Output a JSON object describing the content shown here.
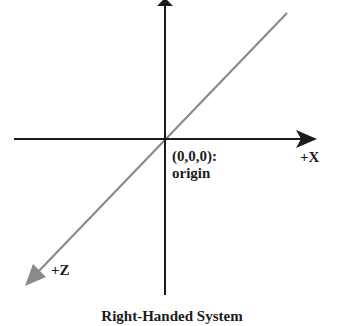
{
  "diagram": {
    "title": "Right-Handed System",
    "origin": {
      "coords_label": "(0,0,0):",
      "name_label": "origin"
    },
    "axes": [
      {
        "id": "y",
        "label": "",
        "direction": "up",
        "color": "#1c1c1c"
      },
      {
        "id": "x",
        "label": "+X",
        "direction": "right",
        "color": "#1c1c1c"
      },
      {
        "id": "z",
        "label": "+Z",
        "direction": "down-left (toward viewer)",
        "color": "#8a8a8a"
      }
    ]
  },
  "colors": {
    "axis_dark": "#1c1c1c",
    "axis_gray": "#8a8a8a",
    "background": "#ffffff"
  }
}
